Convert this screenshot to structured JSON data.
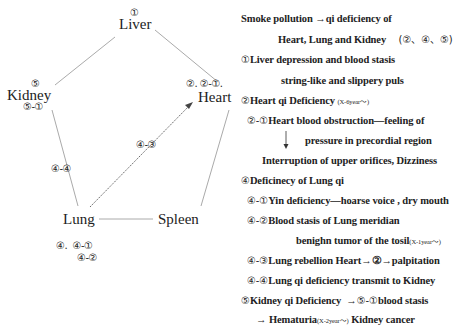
{
  "diagram": {
    "organs": {
      "liver": {
        "label": "Liver",
        "mark": "①"
      },
      "heart": {
        "label": "Heart",
        "mark": "②. ②-①."
      },
      "kidney": {
        "label": "Kidney",
        "mark_top": "⑤",
        "mark_bottom": "⑤-①"
      },
      "lung": {
        "label": "Lung",
        "mark_line1": "④.  ④-①",
        "mark_line2": "④-②"
      },
      "spleen": {
        "label": "Spleen"
      }
    },
    "edge_labels": {
      "lung_kidney": "④-④",
      "lung_heart": "④-③"
    },
    "line_color": "#aaaaaa",
    "arrow_color": "#444444"
  },
  "notes": {
    "line1": "Smoke pollution →qi deficiency of",
    "line2a": "Heart, Lung and  Kidney",
    "line2b": "(②、④、⑤)",
    "line3_mark": "①",
    "line3": "Liver depression and blood stasis",
    "line4": "string-like and slippery puls",
    "line5_mark": "②",
    "line5": "Heart qi Deficiency",
    "line5_small": "(X-6year～)",
    "line6_mark": "②-①",
    "line6": "Heart blood obstruction—feeling of",
    "line7": "pressure in precordial region",
    "line8": "Interruption of upper orifices, Dizziness",
    "line9_mark": "④",
    "line9": "Deficinecy of Lung qi",
    "line10_mark": "④-①",
    "line10": "Yin deficiency—hoarse voice , dry mouth",
    "line11_mark": "④-②",
    "line11": "Blood stasis of Lung meridian",
    "line12": "benighn tumor of the tosil",
    "line12_small": "(X-1year～)",
    "line13_mark": "④-③",
    "line13": "Lung rebellion Heart→②→palpitation",
    "line14_mark": "④-④",
    "line14": "Lung qi deficiency transmit to Kidney",
    "line15_mark": "⑤",
    "line15a": "Kidney qi Deficiency  →",
    "line15_mark2": "⑤-①",
    "line15b": "blood stasis",
    "line16a": "→ Hematuria",
    "line16_small": "(X-2year～)",
    "line16b": " Kidney cancer"
  }
}
